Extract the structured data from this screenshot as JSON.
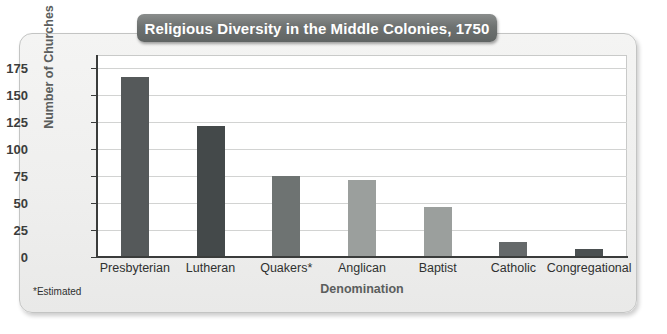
{
  "chart_data": {
    "type": "bar",
    "title": "Religious Diversity in the Middle Colonies, 1750",
    "xlabel": "Denomination",
    "ylabel": "Number of Churches",
    "categories": [
      "Presbyterian",
      "Lutheran",
      "Quakers*",
      "Anglican",
      "Baptist",
      "Catholic",
      "Congregational"
    ],
    "values": [
      167,
      121,
      75,
      71,
      46,
      14,
      7
    ],
    "bar_colors": [
      "#55595a",
      "#44494a",
      "#6e7372",
      "#9b9f9d",
      "#9b9f9d",
      "#65696a",
      "#4b5051"
    ],
    "ylim": [
      0,
      187
    ],
    "yticks": [
      0,
      25,
      50,
      75,
      100,
      125,
      150,
      175
    ],
    "ytick_labels": [
      "0",
      "25",
      "50",
      "75",
      "100",
      "125",
      "150",
      "175"
    ],
    "grid": true,
    "grid_axis": "y",
    "legend": "none",
    "footnote": "*Estimated"
  },
  "colors": {
    "title_banner_bg": "#6e7271",
    "title_text": "#ffffff",
    "card_bg": "#efefee",
    "plot_bg": "#ffffff",
    "axis": "#3a3c3b",
    "gridline": "#d2d3d2",
    "axis_title": "#5b5e5d",
    "tick_text": "#2f3130"
  }
}
